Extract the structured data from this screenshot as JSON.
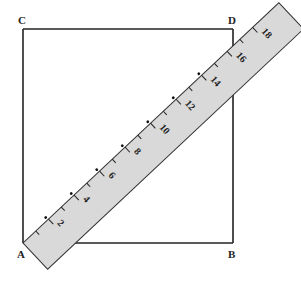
{
  "figure": {
    "type": "geometry-diagram",
    "vertices": {
      "C": {
        "label": "C",
        "x": 23,
        "y": 29
      },
      "D": {
        "label": "D",
        "x": 233,
        "y": 29
      },
      "B": {
        "label": "B",
        "x": 233,
        "y": 243
      },
      "A": {
        "label": "A",
        "x": 23,
        "y": 243
      }
    },
    "ruler": {
      "fill": "#d9d9d9",
      "stroke": "#333333",
      "unit_px": 17.5,
      "angle_deg": -43.2,
      "tick_count": 19,
      "labels": [
        "2",
        "4",
        "6",
        "8",
        "10",
        "12",
        "14",
        "16",
        "18"
      ],
      "dotted_marks": [
        2,
        4,
        6,
        8,
        10,
        12,
        14
      ]
    },
    "colors": {
      "line": "#222222",
      "background": "#ffffff"
    }
  }
}
